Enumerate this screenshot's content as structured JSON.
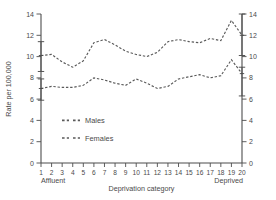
{
  "chart_data": {
    "type": "line",
    "title": "",
    "xlabel": "Deprivation category",
    "ylabel": "Rate per 100,000",
    "ylim": [
      0,
      14
    ],
    "yticks": [
      0,
      2,
      4,
      6,
      8,
      10,
      12,
      14
    ],
    "ytick_labels": [
      "0",
      "2",
      "4",
      "6",
      "8",
      "10",
      "12",
      "14"
    ],
    "right_axis": true,
    "right_ytick_labels": [
      "0",
      "2",
      "4",
      "6",
      "8",
      "10",
      "12",
      "14"
    ],
    "grid": false,
    "legend_position": "lower-left-inside",
    "xlim": [
      1,
      20
    ],
    "categories": [
      1,
      2,
      3,
      4,
      5,
      6,
      7,
      8,
      9,
      10,
      11,
      12,
      13,
      14,
      15,
      16,
      17,
      18,
      19,
      20
    ],
    "xtick_labels": [
      "1",
      "2",
      "3",
      "4",
      "5",
      "6",
      "7",
      "8",
      "9",
      "10",
      "11",
      "12",
      "13",
      "14",
      "15",
      "16",
      "17",
      "18",
      "19",
      "20"
    ],
    "x_end_labels": {
      "left": "Affluent",
      "right": "Deprived"
    },
    "series": [
      {
        "name": "Males",
        "values": [
          10.1,
          10.2,
          9.5,
          9.0,
          9.6,
          11.3,
          11.6,
          11.1,
          10.5,
          10.2,
          10.0,
          10.4,
          11.4,
          11.6,
          11.4,
          11.3,
          11.7,
          11.5,
          13.4,
          12.0
        ]
      },
      {
        "name": "Females",
        "values": [
          7.0,
          7.2,
          7.1,
          7.1,
          7.3,
          8.0,
          7.8,
          7.5,
          7.3,
          7.9,
          7.5,
          7.0,
          7.2,
          7.9,
          8.1,
          8.3,
          8.0,
          8.2,
          9.7,
          8.4
        ]
      }
    ],
    "error_bars": [
      {
        "series": "Males",
        "x": 1,
        "value": 10.1,
        "lower": 8.6,
        "upper": 11.4
      },
      {
        "series": "Females",
        "x": 1,
        "value": 7.0,
        "lower": 5.9,
        "upper": 7.9
      },
      {
        "series": "Males",
        "x": 20,
        "value": 12.0,
        "lower": 10.1,
        "upper": 14.0
      },
      {
        "series": "Females",
        "x": 20,
        "value": 8.4,
        "lower": 6.3,
        "upper": 9.0
      }
    ],
    "legend": [
      {
        "label": "Males",
        "style": "dashed"
      },
      {
        "label": "Females",
        "style": "dashed"
      }
    ],
    "colors": {
      "line": "#5a5a5a",
      "axis": "#4d4d4d",
      "text": "#4a4a4a",
      "background": "#ffffff"
    }
  }
}
